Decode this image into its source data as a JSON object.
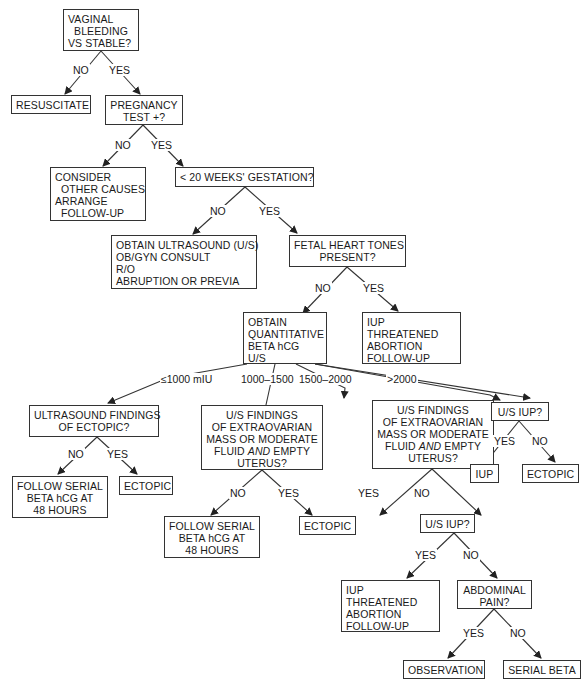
{
  "nodes": {
    "n1": "VAGINAL\n  BLEEDING\nVS STABLE?",
    "n2": "RESUSCITATE",
    "n3": "PREGNANCY\nTEST +?",
    "n4": "CONSIDER\n  OTHER CAUSES\nARRANGE\n  FOLLOW-UP",
    "n5": "< 20 WEEKS' GESTATION?",
    "n6": "OBTAIN ULTRASOUND (U/S)\nOB/GYN CONSULT\nR/O\nABRUPTION OR PREVIA",
    "n7": "FETAL HEART TONES\nPRESENT?",
    "n8": "OBTAIN\nQUANTITATIVE\nBETA hCG\nU/S",
    "n9": "IUP\nTHREATENED\nABORTION\nFOLLOW-UP",
    "n10": "ULTRASOUND FINDINGS\nOF ECTOPIC?",
    "n11": "U/S FINDINGS\nOF EXTRAOVARIAN\nMASS OR MODERATE\nFLUID AND EMPTY\nUTERUS?",
    "n12": "U/S FINDINGS\nOF EXTRAOVARIAN\nMASS OR MODERATE\nFLUID AND EMPTY\nUTERUS?",
    "n13": "U/S IUP?",
    "n14": "FOLLOW SERIAL\nBETA hCG AT\n48 HOURS",
    "n15": "ECTOPIC",
    "n16": "IUP",
    "n17": "ECTOPIC",
    "n18": "FOLLOW SERIAL\nBETA hCG AT\n48 HOURS",
    "n19": "ECTOPIC",
    "n20": "U/S IUP?",
    "n21": "IUP\nTHREATENED\nABORTION\nFOLLOW-UP",
    "n22": "ABDOMINAL\nPAIN?",
    "n23": "OBSERVATION",
    "n24": "SERIAL BETA"
  },
  "edge_labels": {
    "e1_no": "NO",
    "e1_yes": "YES",
    "e3_no": "NO",
    "e3_yes": "YES",
    "e5_no": "NO",
    "e5_yes": "YES",
    "e7_no": "NO",
    "e7_yes": "YES",
    "e8_a": "≤1000 mIU",
    "e8_b": "1000–1500",
    "e8_c": "1500–2000",
    "e8_d": ">2000",
    "e10_no": "NO",
    "e10_yes": "YES",
    "e11_no": "NO",
    "e11_yes": "YES",
    "e12_yes": "YES",
    "e12_no": "NO",
    "e13_yes": "YES",
    "e13_no": "NO",
    "e20_yes": "YES",
    "e20_no": "NO",
    "e22_yes": "YES",
    "e22_no": "NO"
  }
}
